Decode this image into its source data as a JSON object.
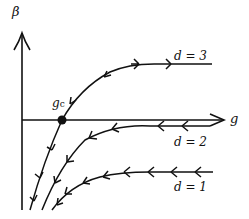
{
  "diagram": {
    "type": "rg-flow-diagram",
    "axes": {
      "y_label": "β",
      "x_label": "g"
    },
    "fixed_point": {
      "label": "g",
      "subscript": "c"
    },
    "curves": [
      {
        "label": "d = 3",
        "direction": "outward",
        "arrow_count": 4
      },
      {
        "label": "d = 2",
        "direction": "inward",
        "arrow_count": 6
      },
      {
        "label": "d = 1",
        "direction": "inward",
        "arrow_count": 8
      }
    ],
    "colors": {
      "stroke": "#111111",
      "background": "#ffffff"
    }
  }
}
